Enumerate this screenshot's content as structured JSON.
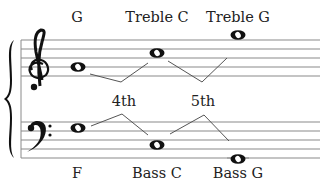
{
  "diagram": {
    "title_labels": {
      "treble_low_g": "G",
      "treble_c": "Treble C",
      "treble_high_g": "Treble G",
      "interval_fourth": "4th",
      "interval_fifth": "5th",
      "bass_f": "F",
      "bass_c": "Bass C",
      "bass_g": "Bass G"
    },
    "clefs": {
      "treble": "treble-clef-icon",
      "bass": "bass-clef-icon"
    },
    "colors": {
      "staff_line": "#8a8a8a",
      "ink": "#111111",
      "connector": "#555555",
      "text": "#222222"
    },
    "notes": [
      {
        "staff": "treble",
        "name": "G",
        "type": "whole"
      },
      {
        "staff": "treble",
        "name": "Treble C",
        "type": "whole"
      },
      {
        "staff": "treble",
        "name": "Treble G",
        "type": "whole"
      },
      {
        "staff": "bass",
        "name": "F",
        "type": "whole"
      },
      {
        "staff": "bass",
        "name": "Bass C",
        "type": "whole"
      },
      {
        "staff": "bass",
        "name": "Bass G",
        "type": "whole"
      }
    ]
  }
}
